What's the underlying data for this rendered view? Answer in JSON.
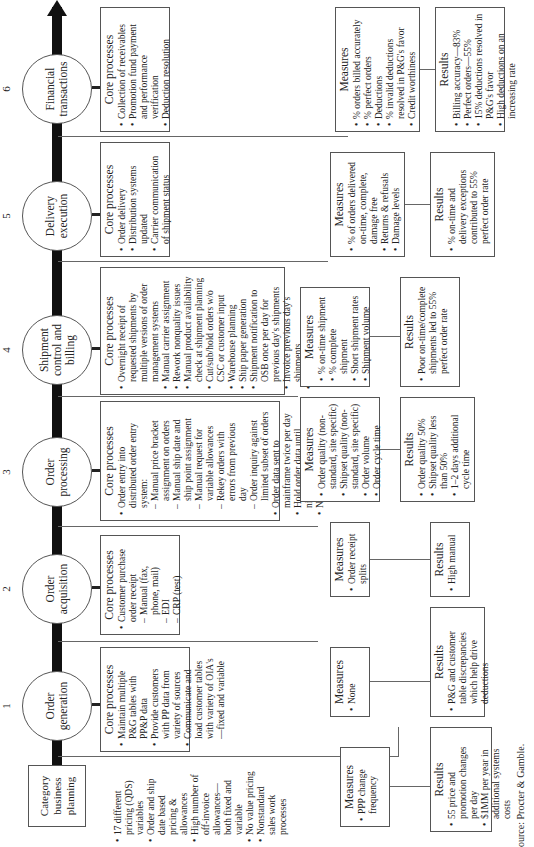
{
  "start": {
    "label": "Category business planning"
  },
  "issues": {
    "items": [
      "17 different pricing (QDS) variables",
      "Order and ship date based pricing & allowances",
      "High number of off-invoice allowances—both fixed and variable",
      "No value pricing",
      "Nonstandard sales work processes"
    ]
  },
  "stages": [
    {
      "number": "1",
      "name": "Order generation",
      "core": {
        "heading": "Core processes",
        "items": [
          {
            "text": "Maintain multiple P&G tables with PP&P data",
            "sub": false
          },
          {
            "text": "Provide customers with PP data from variety of sources",
            "sub": false
          },
          {
            "text": "Communicate and load customer tables with variety of OIA's—fixed and variable",
            "sub": false
          }
        ]
      },
      "measures": {
        "heading": "Measures",
        "items": [
          "None"
        ]
      },
      "results": {
        "heading": "Results",
        "items": [
          "P&G and customer table discrepancies which help drive deductions"
        ]
      }
    },
    {
      "number": "2",
      "name": "Order acquisition",
      "core": {
        "heading": "Core processes",
        "items": [
          {
            "text": "Customer purchase order receipt",
            "sub": false
          },
          {
            "text": "Manual (fax, phone, mail)",
            "sub": true
          },
          {
            "text": "EDI",
            "sub": true
          },
          {
            "text": "CRP (test)",
            "sub": true
          }
        ]
      },
      "measures": {
        "heading": "Measures",
        "items": [
          "Order receipt splits"
        ]
      },
      "results": {
        "heading": "Results",
        "items": [
          "High manual"
        ]
      }
    },
    {
      "number": "3",
      "name": "Order processing",
      "core": {
        "heading": "Core processes",
        "items": [
          {
            "text": "Order entry into distributed order entry system:",
            "sub": false
          },
          {
            "text": "Manual price bracket assignment on orders",
            "sub": true
          },
          {
            "text": "Manual ship date and ship point assignment",
            "sub": true
          },
          {
            "text": "Manual request for variable allowances",
            "sub": true
          },
          {
            "text": "Rekey orders with errors from previous day",
            "sub": true
          },
          {
            "text": "Order inquiry against limited subset of orders",
            "sub": true
          },
          {
            "text": "Order data sent to mainframe twice per day",
            "sub": false
          },
          {
            "text": "Hold order data until nightly OSB run",
            "sub": false
          },
          {
            "text": "Nightly order processing",
            "sub": false
          }
        ]
      },
      "measures": {
        "heading": "Measures",
        "items": [
          "Order quality (non-standard, site specific)",
          "Shipset quality (non-standard, site specific)",
          "Order volume",
          "Order cycle time"
        ]
      },
      "results": {
        "heading": "Results",
        "items": [
          "Order quality 50%",
          "Shipset quality less than 50%",
          "1–2 days additional cycle time"
        ]
      }
    },
    {
      "number": "4",
      "name": "Shipment control and billing",
      "core": {
        "heading": "Core processes",
        "items": [
          {
            "text": "Overnight receipt of requested shipments by multiple versions of order management systems",
            "sub": false
          },
          {
            "text": "Manual carrier assignment",
            "sub": false
          },
          {
            "text": "Rework nonquality issues",
            "sub": false
          },
          {
            "text": "Manual product availability check at shipment planning",
            "sub": false
          },
          {
            "text": "Cut/sub/hold orders w/o CSC or customer input",
            "sub": false
          },
          {
            "text": "Warehouse planning",
            "sub": false
          },
          {
            "text": "Ship paper generation",
            "sub": false
          },
          {
            "text": "Shipment notification to OSB once per day for previous day's shipments",
            "sub": false
          },
          {
            "text": "Invoice previous day's shipments",
            "sub": false
          },
          {
            "text": "Truck loading",
            "sub": false
          }
        ]
      },
      "measures": {
        "heading": "Measures",
        "items": [
          "% on-time shipment",
          "% complete shipment",
          "Short shipment rates",
          "Shipment volume"
        ]
      },
      "results": {
        "heading": "Results",
        "items": [
          "Poor on-time/complete shipments led to 55% perfect order rate"
        ]
      }
    },
    {
      "number": "5",
      "name": "Delivery execution",
      "core": {
        "heading": "Core processes",
        "items": [
          {
            "text": "Order delivery",
            "sub": false
          },
          {
            "text": "Distribution systems updated",
            "sub": false
          },
          {
            "text": "Carrier communication of shipment status",
            "sub": false
          }
        ]
      },
      "measures": {
        "heading": "Measures",
        "items": [
          "% of orders delivered on-time, complete, damage free",
          "Returns & refusals",
          "Damage levels"
        ]
      },
      "results": {
        "heading": "Results",
        "items": [
          "% on-time and delivery exceptions contributed to 55% perfect order rate"
        ]
      }
    },
    {
      "number": "6",
      "name": "Financial transactions",
      "core": {
        "heading": "Core processes",
        "items": [
          {
            "text": "Collection of receivables",
            "sub": false
          },
          {
            "text": "Promotion fund payment and performance verification",
            "sub": false
          },
          {
            "text": "Deduction resolution",
            "sub": false
          }
        ]
      },
      "measures": {
        "heading": "Measures",
        "items": [
          "% orders billed accurately",
          "% perfect orders",
          "Deductions",
          "% invalid deductions resolved in P&G's favor",
          "Credit worthiness"
        ]
      },
      "results": {
        "heading": "Results",
        "items": [
          "Billing accuracy—83%",
          "Perfect orders—55%",
          "15% deductions resolved in P&G's favor",
          "High deductions on an increasing rate"
        ]
      }
    }
  ],
  "planning": {
    "measures": {
      "heading": "Measures",
      "items": [
        "PPP change frequency"
      ]
    },
    "results": {
      "heading": "Results",
      "items": [
        "55 price and promotion changes per day",
        "$1MM per year in additional systems costs"
      ]
    }
  },
  "source": "ource: Procter & Gamble."
}
